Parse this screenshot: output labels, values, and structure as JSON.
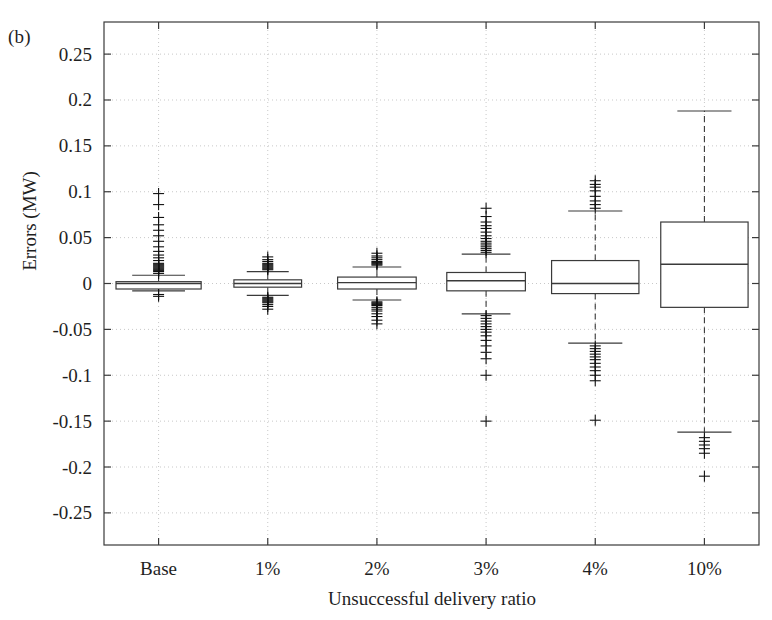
{
  "figure": {
    "panel_label": "(b)",
    "background": "#ffffff",
    "axis_color": "#3a3a3a",
    "grid_color": "#c8c8c8",
    "box_color": "#3a3a3a",
    "marker_color": "#111111"
  },
  "chart_data": {
    "type": "box",
    "title": "",
    "panel": "(b)",
    "xlabel": "Unsuccessful delivery ratio",
    "ylabel": "Errors (MW)",
    "categories": [
      "Base",
      "1%",
      "2%",
      "3%",
      "4%",
      "10%"
    ],
    "ylim": [
      -0.285,
      0.285
    ],
    "yticks": [
      0.25,
      0.2,
      0.15,
      0.1,
      0.05,
      0,
      -0.05,
      -0.1,
      -0.15,
      -0.2,
      -0.25
    ],
    "ytick_labels": [
      "0.25",
      "0.2",
      "0.15",
      "0.1",
      "0.05",
      "0",
      "-0.05",
      "-0.1",
      "-0.15",
      "-0.2",
      "-0.25"
    ],
    "grid": true,
    "grid_style": "dotted",
    "legend": null,
    "boxes": [
      {
        "category": "Base",
        "box_width": 0.78,
        "q1": -0.006,
        "median": 0.0,
        "q3": 0.002,
        "whisker_low": -0.008,
        "whisker_high": 0.009,
        "outliers_high": [
          0.011,
          0.013,
          0.014,
          0.015,
          0.016,
          0.017,
          0.018,
          0.019,
          0.02,
          0.021,
          0.022,
          0.025,
          0.028,
          0.031,
          0.035,
          0.04,
          0.046,
          0.052,
          0.058,
          0.064,
          0.072,
          0.086,
          0.098
        ],
        "outliers_low": [
          -0.012,
          -0.014
        ]
      },
      {
        "category": "1%",
        "box_width": 0.62,
        "q1": -0.004,
        "median": 0.0,
        "q3": 0.004,
        "whisker_low": -0.013,
        "whisker_high": 0.013,
        "outliers_high": [
          0.015,
          0.016,
          0.017,
          0.018,
          0.019,
          0.02,
          0.021,
          0.022,
          0.024,
          0.026,
          0.029
        ],
        "outliers_low": [
          -0.015,
          -0.016,
          -0.017,
          -0.018,
          -0.019,
          -0.02,
          -0.021,
          -0.023,
          -0.025,
          -0.028
        ]
      },
      {
        "category": "2%",
        "box_width": 0.72,
        "q1": -0.006,
        "median": 0.001,
        "q3": 0.007,
        "whisker_low": -0.018,
        "whisker_high": 0.018,
        "outliers_high": [
          0.02,
          0.021,
          0.022,
          0.023,
          0.024,
          0.026,
          0.028,
          0.03,
          0.033
        ],
        "outliers_low": [
          -0.02,
          -0.021,
          -0.022,
          -0.023,
          -0.024,
          -0.026,
          -0.028,
          -0.03,
          -0.033,
          -0.036,
          -0.04,
          -0.044
        ]
      },
      {
        "category": "3%",
        "box_width": 0.72,
        "q1": -0.008,
        "median": 0.003,
        "q3": 0.012,
        "whisker_low": -0.033,
        "whisker_high": 0.032,
        "outliers_high": [
          0.034,
          0.036,
          0.038,
          0.04,
          0.042,
          0.044,
          0.046,
          0.049,
          0.052,
          0.056,
          0.06,
          0.063,
          0.067,
          0.073,
          0.082
        ],
        "outliers_low": [
          -0.035,
          -0.038,
          -0.041,
          -0.044,
          -0.047,
          -0.05,
          -0.053,
          -0.057,
          -0.062,
          -0.068,
          -0.075,
          -0.082,
          -0.1,
          -0.15
        ]
      },
      {
        "category": "4%",
        "box_width": 0.8,
        "q1": -0.011,
        "median": 0.0,
        "q3": 0.025,
        "whisker_low": -0.065,
        "whisker_high": 0.079,
        "outliers_high": [
          0.082,
          0.086,
          0.09,
          0.095,
          0.101,
          0.105,
          0.108,
          0.112
        ],
        "outliers_low": [
          -0.068,
          -0.071,
          -0.074,
          -0.077,
          -0.08,
          -0.083,
          -0.087,
          -0.091,
          -0.095,
          -0.1,
          -0.106,
          -0.149
        ]
      },
      {
        "category": "10%",
        "box_width": 0.8,
        "q1": -0.026,
        "median": 0.021,
        "q3": 0.067,
        "whisker_low": -0.162,
        "whisker_high": 0.188,
        "outliers_high": [],
        "outliers_low": [
          -0.168,
          -0.172,
          -0.176,
          -0.18,
          -0.185,
          -0.21
        ]
      }
    ]
  }
}
